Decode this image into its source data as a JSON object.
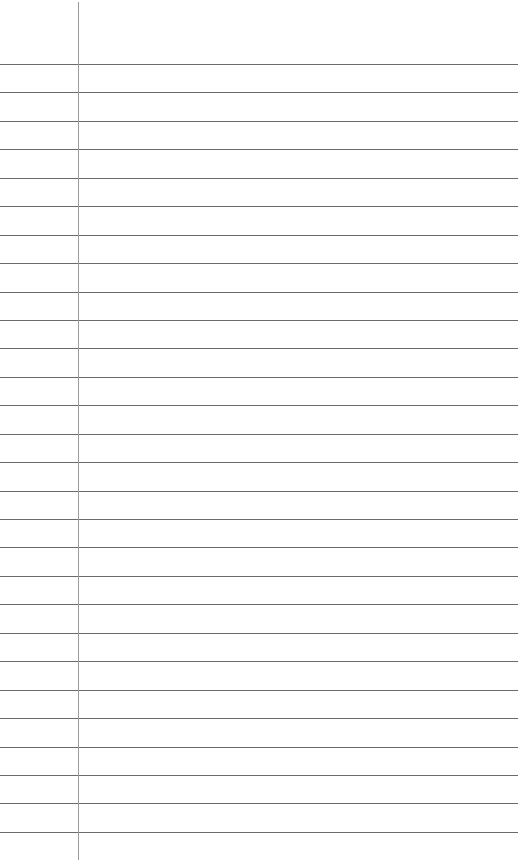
{
  "paper": {
    "type": "lined notebook paper",
    "line_count": 28,
    "first_line_y": 64,
    "line_spacing": 28.44,
    "margin_x": 78,
    "line_color": "#6a6a6a",
    "margin_color": "#9a9a9a"
  }
}
